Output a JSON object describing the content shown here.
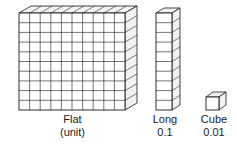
{
  "figure": {
    "background_color": "#ffffff",
    "line_color": "#1a1a1a",
    "face_color": "#ffffff",
    "shade_color": "#f2f2f2"
  },
  "blocks": {
    "flat": {
      "name": "Flat",
      "label_line1": "Flat",
      "label_line2": "(unit)",
      "value": "1",
      "grid_columns": 10,
      "grid_rows": 10,
      "unit_count": 100
    },
    "long": {
      "name": "Long",
      "label_line1": "Long",
      "label_line2": "0.1",
      "value": "0.1",
      "grid_columns": 1,
      "grid_rows": 10,
      "unit_count": 10
    },
    "cube": {
      "name": "Cube",
      "label_line1": "Cube",
      "label_line2": "0.01",
      "value": "0.01",
      "grid_columns": 1,
      "grid_rows": 1,
      "unit_count": 1
    }
  }
}
